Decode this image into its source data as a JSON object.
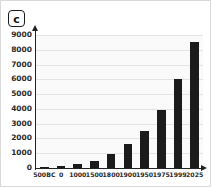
{
  "panel": {
    "label": "c"
  },
  "chart_data": {
    "type": "bar",
    "title": "",
    "subtitle": "",
    "xlabel": "",
    "ylabel": "",
    "categories": [
      "500BC",
      "0",
      "1000",
      "1500",
      "1800",
      "1900",
      "1950",
      "1975",
      "1999",
      "2025"
    ],
    "values": [
      100,
      170,
      300,
      500,
      950,
      1650,
      2500,
      3900,
      6000,
      8500
    ],
    "series": [
      {
        "name": "",
        "values": [
          100,
          170,
          300,
          500,
          950,
          1650,
          2500,
          3900,
          6000,
          8500
        ]
      }
    ],
    "ylim": [
      0,
      9000
    ],
    "xlim": [
      0,
      10
    ],
    "ytick_labels": [
      "0",
      "1000",
      "2000",
      "3000",
      "4000",
      "5000",
      "6000",
      "7000",
      "8000",
      "9000"
    ],
    "ytick_values": [
      0,
      1000,
      2000,
      3000,
      4000,
      5000,
      6000,
      7000,
      8000,
      9000
    ],
    "xtick_labels": [
      "500BC",
      "0",
      "1000",
      "1500",
      "1800",
      "1900",
      "1950",
      "1975",
      "1999",
      "2025"
    ],
    "grid": true,
    "grid_axis": "y",
    "legend": false,
    "legend_position": "none",
    "bar_color": "#1b1b1b",
    "plot_background": "#fafafa",
    "gridline_color": "#e4e4e4",
    "axis_color": "#222222",
    "annotations": []
  }
}
